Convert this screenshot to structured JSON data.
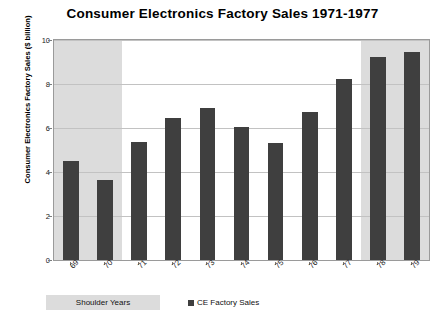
{
  "chart_data": {
    "type": "bar",
    "title": "Consumer Electronics Factory Sales 1971-1977",
    "xlabel": "",
    "ylabel": "Consumer Electronics Factory Sales ($ billion)",
    "categories": [
      "69",
      "70",
      "71",
      "72",
      "73",
      "74",
      "75",
      "76",
      "77",
      "78",
      "79"
    ],
    "values": [
      4.5,
      3.65,
      5.35,
      6.45,
      6.9,
      6.05,
      5.3,
      6.75,
      8.25,
      9.25,
      9.45
    ],
    "series": [
      {
        "name": "CE Factory Sales",
        "values": [
          4.5,
          3.65,
          5.35,
          6.45,
          6.9,
          6.05,
          5.3,
          6.75,
          8.25,
          9.25,
          9.45
        ]
      }
    ],
    "ylim": [
      0,
      10
    ],
    "y_ticks": [
      0,
      2,
      4,
      6,
      8,
      10
    ],
    "y_tick_labels": [
      "0",
      "2",
      "4",
      "6",
      "8",
      "10"
    ],
    "grid": true,
    "legend_position": "below",
    "legend_entries": [
      "CE Factory Sales"
    ],
    "bar_color": "#3f3f3f",
    "shaded_band_color": "#dcdcdc",
    "shaded_bands": [
      {
        "label": "Shoulder Years",
        "from": "69",
        "to": "70"
      },
      {
        "label": "Shoulder Years",
        "from": "78",
        "to": "79"
      }
    ],
    "annotations": [
      "Shoulder Years"
    ]
  },
  "legend": {
    "shoulder_label": "Shoulder Years",
    "series_label": "CE Factory Sales"
  }
}
